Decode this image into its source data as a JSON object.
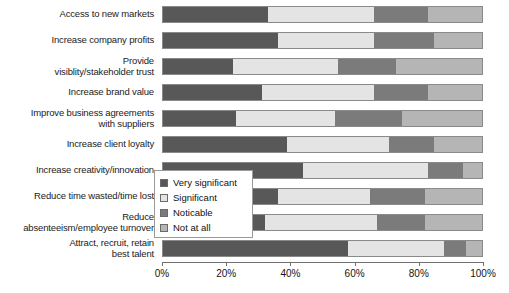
{
  "chart_data": {
    "type": "bar",
    "orientation": "horizontal",
    "stacked": true,
    "stack_mode": "percent",
    "title": "",
    "xlabel": "",
    "ylabel": "",
    "xlim": [
      0,
      100
    ],
    "grid": false,
    "legend_position": "inside-left-middle",
    "xtick_labels": [
      "0%",
      "20%",
      "40%",
      "60%",
      "80%",
      "100%"
    ],
    "xtick_values": [
      0,
      20,
      40,
      60,
      80,
      100
    ],
    "categories": [
      "Access to new markets",
      "Increase company profits",
      "Provide visiblity/stakeholder trust",
      "Increase brand value",
      "Improve business agreements with suppliers",
      "Increase client loyalty",
      "Increase creativity/innovation",
      "Reduce time wasted/time lost",
      "Reduce absenteeism/employee turnover",
      "Attract, recruit, retain best talent"
    ],
    "series": [
      {
        "name": "Very significant",
        "color": "#585858",
        "values": [
          33,
          36,
          22,
          31,
          23,
          39,
          44,
          36,
          32,
          58
        ]
      },
      {
        "name": "Significant",
        "color": "#e4e4e4",
        "values": [
          33,
          30,
          33,
          35,
          31,
          32,
          39,
          29,
          35,
          30
        ]
      },
      {
        "name": "Noticable",
        "color": "#7b7b7b",
        "values": [
          17,
          19,
          18,
          17,
          21,
          14,
          11,
          17,
          15,
          7
        ]
      },
      {
        "name": "Not at all",
        "color": "#b5b5b5",
        "values": [
          17,
          15,
          27,
          17,
          25,
          15,
          6,
          18,
          18,
          5
        ]
      }
    ]
  },
  "labels": {
    "lines": [
      [
        "Access to new markets"
      ],
      [
        "Increase company profits"
      ],
      [
        "Provide",
        "visiblity/stakeholder trust"
      ],
      [
        "Increase brand value"
      ],
      [
        "Improve business agreements",
        "with suppliers"
      ],
      [
        "Increase client loyalty"
      ],
      [
        "Increase creativity/innovation"
      ],
      [
        "Reduce time wasted/time lost"
      ],
      [
        "Reduce",
        "absenteeism/employee turnover"
      ],
      [
        "Attract, recruit, retain",
        "best talent"
      ]
    ]
  },
  "legend": {
    "items": [
      {
        "label": "Very significant",
        "color": "#585858"
      },
      {
        "label": "Significant",
        "color": "#e4e4e4"
      },
      {
        "label": "Noticable",
        "color": "#7b7b7b"
      },
      {
        "label": "Not at all",
        "color": "#b5b5b5"
      }
    ]
  }
}
